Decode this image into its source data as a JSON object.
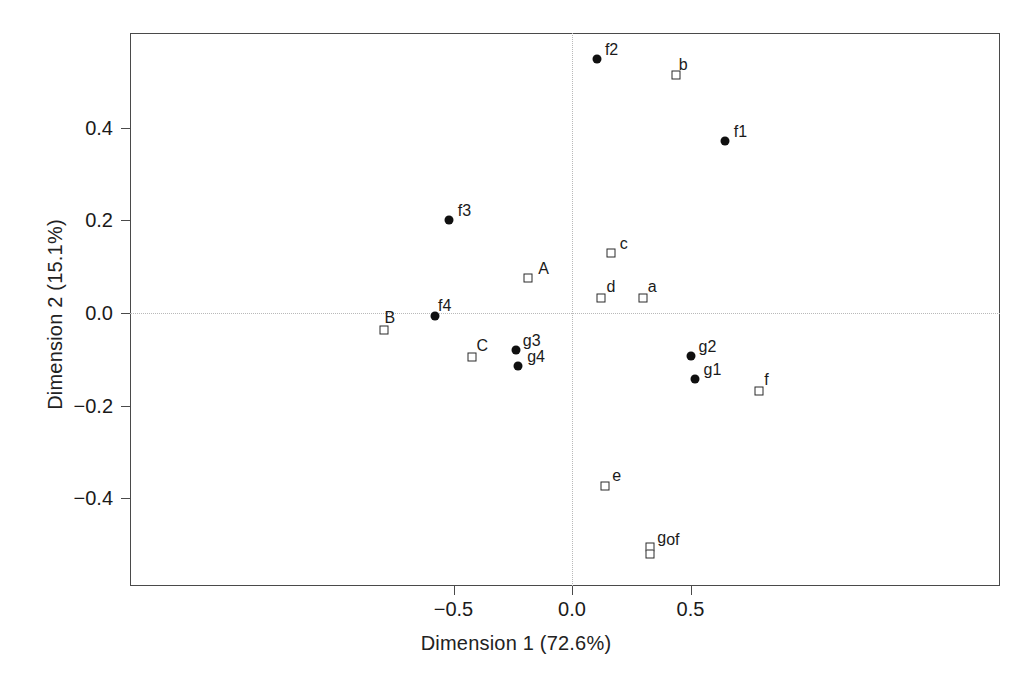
{
  "chart_data": {
    "type": "scatter",
    "title": "",
    "xlabel": "Dimension 1 (72.6%)",
    "ylabel": "Dimension 2 (15.1%)",
    "xlim": [
      -0.88,
      0.89
    ],
    "ylim": [
      -0.58,
      0.6
    ],
    "xticks": [
      -0.5,
      0.0,
      0.5
    ],
    "xticklabels": [
      "-0.5",
      "0.0",
      "0.5"
    ],
    "yticks": [
      0.4,
      0.2,
      0.0,
      -0.2,
      -0.4
    ],
    "yticklabels": [
      "0.4",
      "0.2",
      "0.0",
      "-0.2",
      "-0.4"
    ],
    "grid": false,
    "reference_lines": {
      "horizontal": 0.0,
      "vertical": 0.0,
      "style": "dotted",
      "color": "#b9b9b9"
    },
    "legend_position": "none",
    "marker_styles": {
      "filled_circle": "rows / active points (solid black circle)",
      "open_square": "columns / supplementary points (open square)"
    },
    "series": [
      {
        "name": "filled-circle",
        "marker": "filled_circle",
        "color": "#101010",
        "points": [
          {
            "label": "f2",
            "x": 0.105,
            "y": 0.548,
            "label_dx": 8,
            "label_dy": -17
          },
          {
            "label": "f1",
            "x": 0.645,
            "y": 0.372,
            "label_dx": 9,
            "label_dy": -17
          },
          {
            "label": "f3",
            "x": -0.52,
            "y": 0.2,
            "label_dx": 9,
            "label_dy": -17
          },
          {
            "label": "f4",
            "x": -0.578,
            "y": -0.007,
            "label_dx": 3,
            "label_dy": -18
          },
          {
            "label": "g3",
            "x": -0.237,
            "y": -0.08,
            "label_dx": 7,
            "label_dy": -17
          },
          {
            "label": "g4",
            "x": -0.227,
            "y": -0.114,
            "label_dx": 9,
            "label_dy": -17
          },
          {
            "label": "g2",
            "x": 0.5,
            "y": -0.093,
            "label_dx": 8,
            "label_dy": -17
          },
          {
            "label": "g1",
            "x": 0.517,
            "y": -0.142,
            "label_dx": 9,
            "label_dy": -17
          }
        ]
      },
      {
        "name": "open-square",
        "marker": "open_square",
        "color": "#2a2a2a",
        "points": [
          {
            "label": "b",
            "x": 0.438,
            "y": 0.513,
            "label_dx": 3,
            "label_dy": -18
          },
          {
            "label": "c",
            "x": 0.164,
            "y": 0.129,
            "label_dx": 9,
            "label_dy": -17
          },
          {
            "label": "A",
            "x": -0.185,
            "y": 0.076,
            "label_dx": 10,
            "label_dy": -17
          },
          {
            "label": "d",
            "x": 0.124,
            "y": 0.032,
            "label_dx": 5,
            "label_dy": -19
          },
          {
            "label": "a",
            "x": 0.298,
            "y": 0.032,
            "label_dx": 5,
            "label_dy": -19
          },
          {
            "label": "B",
            "x": -0.795,
            "y": -0.037,
            "label_dx": 1,
            "label_dy": -20
          },
          {
            "label": "C",
            "x": -0.42,
            "y": -0.095,
            "label_dx": 4,
            "label_dy": -19
          },
          {
            "label": "f",
            "x": 0.79,
            "y": -0.168,
            "label_dx": 5,
            "label_dy": -19
          },
          {
            "label": "e",
            "x": 0.14,
            "y": -0.373,
            "label_dx": 7,
            "label_dy": -18
          },
          {
            "label": "g",
            "x": 0.33,
            "y": -0.505,
            "label_dx": 7,
            "label_dy": -17
          },
          {
            "label": "of",
            "x": 0.33,
            "y": -0.52,
            "label_dx": 16,
            "label_dy": -22
          }
        ]
      }
    ]
  },
  "geometry": {
    "frame": {
      "left": 130,
      "top": 33,
      "width": 870,
      "height": 553
    },
    "x_origin_px": 572,
    "y_origin_px": 313,
    "px_per_x_unit": 237.0,
    "px_per_y_unit": 463.0
  }
}
